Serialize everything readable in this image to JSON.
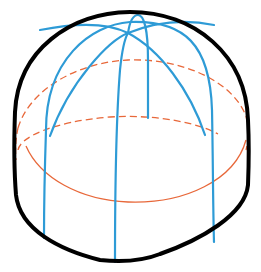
{
  "diagram": {
    "colors": {
      "background": "#ffffff",
      "outline": "#000000",
      "meridians": "#2e9bd6",
      "latitudes": "#e8683a"
    },
    "elements": {
      "outline": "silhouette-outline",
      "meridians": [
        "meridian-arch-left-right",
        "meridian-arch-front-diagonal",
        "meridian-front-center",
        "meridian-back-loop",
        "meridian-right"
      ],
      "latitudes": [
        "upper-latitude-dashed",
        "lower-latitude-back-dashed",
        "lower-latitude-front-solid"
      ]
    }
  }
}
